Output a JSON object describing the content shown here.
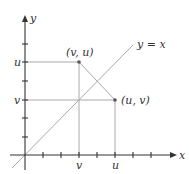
{
  "diagram": {
    "axes": {
      "x_label": "x",
      "y_label": "y"
    },
    "line_label": "y = x",
    "tick_labels": {
      "x_v": "v",
      "x_u": "u",
      "y_u": "u",
      "y_v": "v"
    },
    "points": [
      {
        "label": "(v, u)",
        "x": 3,
        "y": 5
      },
      {
        "label": "(u, v)",
        "x": 5,
        "y": 3
      }
    ],
    "colors": {
      "axis": "#333333",
      "guide": "#9a9a9a",
      "point": "#555555"
    }
  }
}
